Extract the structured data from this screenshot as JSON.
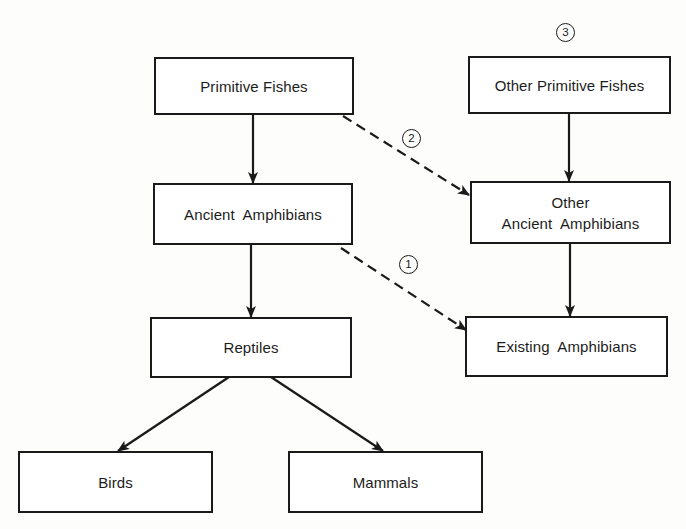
{
  "diagram": {
    "type": "flowchart",
    "nodes": [
      {
        "id": "primitive-fishes",
        "lines": [
          "Primitive Fishes"
        ]
      },
      {
        "id": "ancient-amphibians",
        "lines": [
          "Ancient  Amphibians"
        ]
      },
      {
        "id": "reptiles",
        "lines": [
          "Reptiles"
        ]
      },
      {
        "id": "birds",
        "lines": [
          "Birds"
        ]
      },
      {
        "id": "mammals",
        "lines": [
          "Mammals"
        ]
      },
      {
        "id": "other-primitive-fishes",
        "lines": [
          "Other Primitive Fishes"
        ]
      },
      {
        "id": "other-ancient-amphibians",
        "lines": [
          "Other",
          "Ancient  Amphibians"
        ]
      },
      {
        "id": "existing-amphibians",
        "lines": [
          "Existing  Amphibians"
        ]
      }
    ],
    "edges": [
      {
        "from": "primitive-fishes",
        "to": "ancient-amphibians",
        "style": "solid"
      },
      {
        "from": "ancient-amphibians",
        "to": "reptiles",
        "style": "solid"
      },
      {
        "from": "reptiles",
        "to": "birds",
        "style": "solid"
      },
      {
        "from": "reptiles",
        "to": "mammals",
        "style": "solid"
      },
      {
        "from": "other-primitive-fishes",
        "to": "other-ancient-amphibians",
        "style": "solid"
      },
      {
        "from": "other-ancient-amphibians",
        "to": "existing-amphibians",
        "style": "solid"
      },
      {
        "from": "primitive-fishes",
        "to": "other-ancient-amphibians",
        "style": "dashed",
        "label": "2"
      },
      {
        "from": "ancient-amphibians",
        "to": "existing-amphibians",
        "style": "dashed",
        "label": "1"
      }
    ],
    "markers": [
      {
        "id": "marker-3",
        "label": "3",
        "attached_to": "other-primitive-fishes"
      },
      {
        "id": "marker-2",
        "label": "2",
        "attached_to": "dashed-edge-primitive-fishes-to-other-ancient-amphibians"
      },
      {
        "id": "marker-1",
        "label": "1",
        "attached_to": "dashed-edge-ancient-amphibians-to-existing-amphibians"
      }
    ],
    "colors": {
      "line": "#1a1a1a",
      "background": "#ffffff"
    }
  }
}
